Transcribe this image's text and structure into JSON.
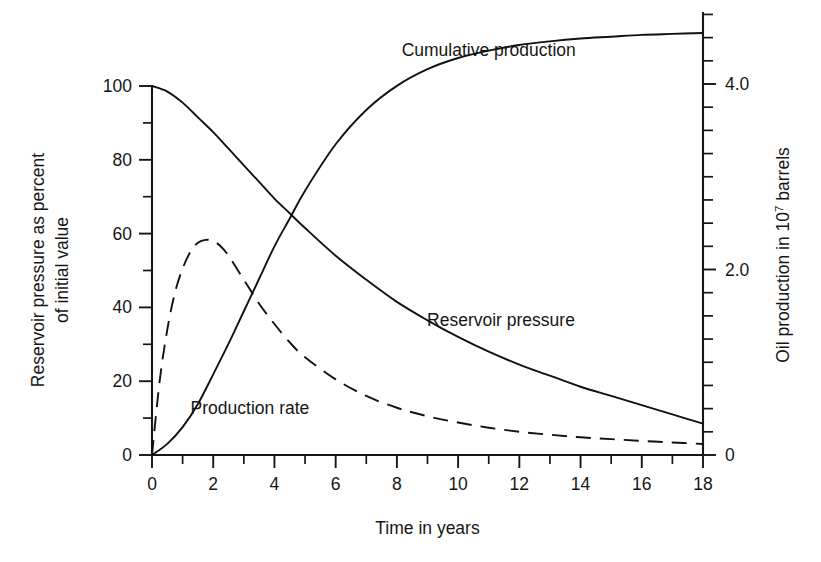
{
  "chart_data": {
    "type": "line",
    "title": "",
    "xlabel": "Time in years",
    "ylabel": "Reservoir pressure as percent of initial value",
    "ylabel_line1": "Reservoir pressure as percent",
    "ylabel_line2": "of initial value",
    "y2label": "Oil production in 10⁷ barrels",
    "y2label_base": "Oil production in 10",
    "y2label_exponent": "7",
    "y2label_tail": " barrels",
    "xlim": [
      0,
      18
    ],
    "ylim": [
      0,
      100
    ],
    "y2lim": [
      0,
      4.9
    ],
    "grid": false,
    "legend_position": "inline-annotations",
    "xticks": [
      0,
      1,
      2,
      3,
      4,
      5,
      6,
      7,
      8,
      9,
      10,
      11,
      12,
      13,
      14,
      15,
      16,
      17,
      18
    ],
    "xtick_labels": [
      "0",
      "",
      "2",
      "",
      "4",
      "",
      "6",
      "",
      "8",
      "",
      "10",
      "",
      "12",
      "",
      "14",
      "",
      "16",
      "",
      "18"
    ],
    "xtick_labels_shown": [
      "0",
      "2",
      "4",
      "6",
      "8",
      "10",
      "12",
      "14",
      "16",
      "18"
    ],
    "yticks": [
      0,
      10,
      20,
      30,
      40,
      50,
      60,
      70,
      80,
      90,
      100
    ],
    "ytick_labels_shown": [
      "0",
      "20",
      "40",
      "60",
      "80",
      "100"
    ],
    "y2ticks": [
      0,
      0.25,
      0.5,
      0.75,
      1.0,
      1.25,
      1.5,
      1.75,
      2.0,
      2.25,
      2.5,
      2.75,
      3.0,
      3.25,
      3.5,
      3.75,
      4.0,
      4.25,
      4.5,
      4.75
    ],
    "y2tick_labels_shown": [
      "0",
      "2.0",
      "4.0"
    ],
    "series": [
      {
        "name": "Reservoir pressure",
        "label": "Reservoir pressure",
        "axis": "left",
        "style": "solid",
        "color": "#111111",
        "x": [
          0,
          0.5,
          1,
          1.5,
          2,
          2.5,
          3,
          3.5,
          4,
          4.5,
          5,
          6,
          7,
          8,
          9,
          10,
          11,
          12,
          13,
          14,
          15,
          16,
          17,
          18
        ],
        "values": [
          100,
          98.5,
          95.5,
          91.5,
          87.5,
          83,
          78.5,
          74,
          69.5,
          65.5,
          61.5,
          54,
          47.5,
          41.5,
          36.5,
          32,
          28,
          24.5,
          21.5,
          18.5,
          16,
          13.5,
          11,
          8.5
        ],
        "annotation": {
          "text": "Reservoir pressure",
          "x": 11.4,
          "y": 35
        }
      },
      {
        "name": "Cumulative production",
        "label": "Cumulative production",
        "axis": "right",
        "style": "solid",
        "color": "#111111",
        "x": [
          0,
          0.5,
          1,
          1.5,
          2,
          2.5,
          3,
          3.5,
          4,
          4.5,
          5,
          6,
          7,
          8,
          9,
          10,
          11,
          12,
          13,
          14,
          15,
          16,
          17,
          18
        ],
        "values": [
          0,
          0.12,
          0.3,
          0.55,
          0.87,
          1.2,
          1.55,
          1.9,
          2.25,
          2.55,
          2.85,
          3.35,
          3.72,
          3.98,
          4.16,
          4.28,
          4.36,
          4.42,
          4.46,
          4.49,
          4.51,
          4.53,
          4.54,
          4.55
        ],
        "annotation": {
          "text": "Cumulative production",
          "x": 11.0,
          "y": 4.3
        }
      },
      {
        "name": "Production rate",
        "label": "Production rate",
        "axis": "left",
        "style": "dashed",
        "color": "#111111",
        "x": [
          0,
          0.25,
          0.5,
          0.75,
          1,
          1.25,
          1.5,
          1.75,
          2,
          2.25,
          2.5,
          3,
          3.5,
          4,
          4.5,
          5,
          6,
          7,
          8,
          9,
          10,
          11,
          12,
          13,
          14,
          15,
          16,
          17,
          18
        ],
        "values": [
          0,
          20,
          34,
          44,
          50.5,
          55,
          57.5,
          58.3,
          58,
          56.5,
          54,
          47.5,
          41,
          35.5,
          30.5,
          26.5,
          20.5,
          16,
          12.8,
          10.5,
          8.8,
          7.4,
          6.3,
          5.5,
          4.8,
          4.3,
          3.8,
          3.4,
          3.0
        ],
        "annotation": {
          "text": "Production rate",
          "x": 3.2,
          "y": 11
        }
      }
    ],
    "annotations": [
      {
        "text": "Cumulative production",
        "series": "Cumulative production"
      },
      {
        "text": "Reservoir pressure",
        "series": "Reservoir pressure"
      },
      {
        "text": "Production rate",
        "series": "Production rate"
      }
    ]
  }
}
